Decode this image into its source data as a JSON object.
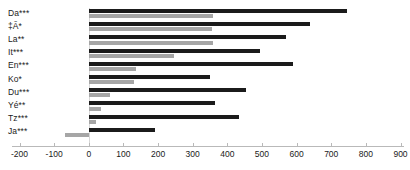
{
  "chart_data": {
    "type": "bar",
    "orientation": "horizontal",
    "title": "",
    "xlabel": "",
    "ylabel": "",
    "xlim": [
      -200,
      900
    ],
    "xticks": [
      -200,
      -100,
      0,
      100,
      200,
      300,
      400,
      500,
      600,
      700,
      800,
      900
    ],
    "xticklabels": [
      "-200",
      "-100",
      "0",
      "100",
      "200",
      "300",
      "400",
      "500",
      "600",
      "700",
      "800",
      "900"
    ],
    "grid": false,
    "legend": "none",
    "categories": [
      "Da***",
      "‡Ã*",
      "La**",
      "It***",
      "En***",
      "Ko*",
      "Du***",
      "Yé**",
      "Tz***",
      "Ja***"
    ],
    "series": [
      {
        "name": "series-dark",
        "color": "#1b1b1b",
        "values": [
          745,
          640,
          570,
          495,
          590,
          350,
          455,
          365,
          435,
          190
        ]
      },
      {
        "name": "series-gray",
        "color": "#a6a6a6",
        "values": [
          360,
          355,
          360,
          245,
          135,
          130,
          60,
          35,
          20,
          -70
        ]
      }
    ]
  },
  "axis": {
    "zero_value": 0,
    "tick_count": 12
  }
}
